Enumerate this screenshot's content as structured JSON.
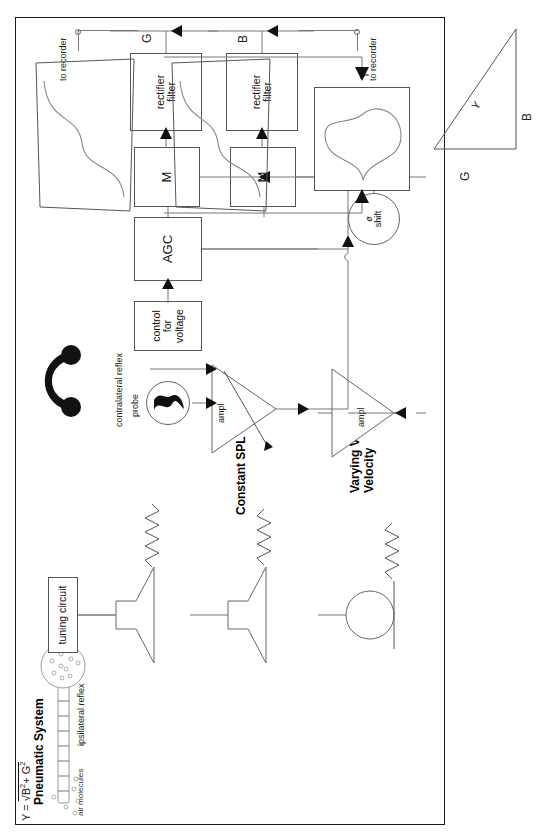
{
  "figure": {
    "border_color": "#1a1a1a"
  },
  "pneumatic": {
    "heading": "Pneumatic System",
    "air_molecules_label": "air molecules",
    "ipsilateral_label": "ipsilateral reflex",
    "tuning_circuit_label": "tuning circuit"
  },
  "sources": {
    "constant_spl_label": "Constant SPL",
    "varying_vv_label_line1": "Varying Volume",
    "varying_vv_label_line2": "Velocity"
  },
  "contralateral": {
    "label": "contralateral reflex",
    "icon": "headphones-icon"
  },
  "probe": {
    "label": "probe",
    "icon": "probe-squiggle-icon"
  },
  "blocks": {
    "control_for_voltage_line1": "control",
    "control_for_voltage_line2": "for",
    "control_for_voltage_line3": "voltage",
    "agc": "AGC",
    "ampl_top": "ampl",
    "ampl_mid": "ampl",
    "mixer_g": "M",
    "mixer_b": "M",
    "rectifier_line1": "rectifier",
    "rectifier_line2": "filter",
    "phase_shift_line1": "ø",
    "phase_shift_line2": "shift"
  },
  "outputs": {
    "g_label": "G",
    "b_label": "B",
    "y_label": "Y",
    "to_recorder_g": "to recorder",
    "to_recorder_b": "to recorder"
  },
  "triangle": {
    "side_g": "G",
    "side_b": "B",
    "hypotenuse_y": "Y",
    "formula_prefix": "Y = ",
    "formula_radical": "√",
    "formula_b": "B",
    "formula_b_exp": "2",
    "formula_plus": "+ ",
    "formula_g": "G",
    "formula_g_exp": "2",
    "formula_full": "Y = √(B² + G²)"
  },
  "colors": {
    "line": "#777777",
    "box_stroke": "#555555",
    "text": "#111111",
    "wave": "#888888"
  }
}
